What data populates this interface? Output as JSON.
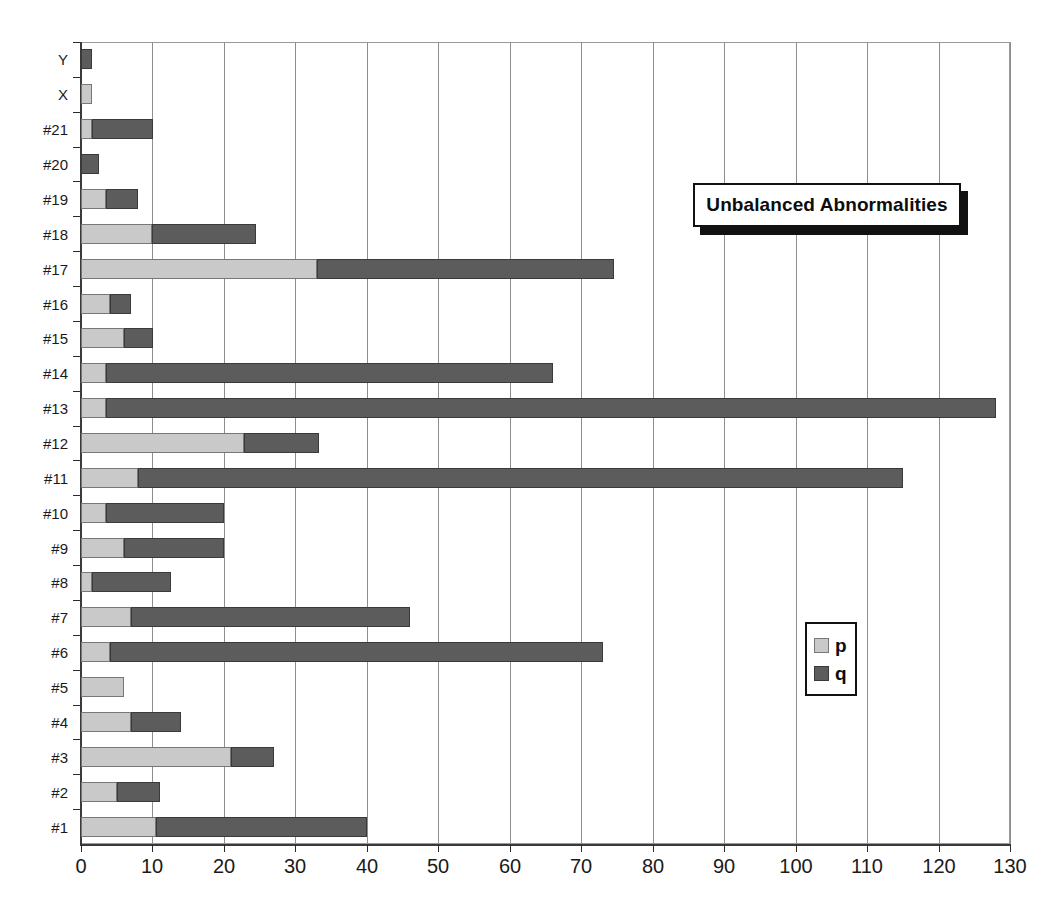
{
  "chart_data": {
    "type": "bar",
    "orientation": "horizontal",
    "stacked": true,
    "title": "Unbalanced Abnormalities",
    "xlabel": "",
    "ylabel": "",
    "xlim": [
      0,
      130
    ],
    "xticks": [
      0,
      10,
      20,
      30,
      40,
      50,
      60,
      70,
      80,
      90,
      100,
      110,
      120,
      130
    ],
    "xticklabels": [
      "0",
      "10",
      "20",
      "30",
      "40",
      "50",
      "60",
      "70",
      "80",
      "90",
      "100",
      "110",
      "120",
      "130"
    ],
    "grid": "vertical",
    "legend_position": "inside-right",
    "categories": [
      "#1",
      "#2",
      "#3",
      "#4",
      "#5",
      "#6",
      "#7",
      "#8",
      "#9",
      "#10",
      "#11",
      "#12",
      "#13",
      "#14",
      "#15",
      "#16",
      "#17",
      "#18",
      "#19",
      "#20",
      "#21",
      "X",
      "Y"
    ],
    "series": [
      {
        "name": "p",
        "color": "#c9c9c9",
        "values": [
          10.5,
          5,
          21,
          7,
          6,
          4,
          7,
          1.5,
          6,
          3.5,
          8,
          22.8,
          3.5,
          3.5,
          6,
          4,
          33,
          10,
          3.5,
          0,
          1.5,
          1.5,
          0
        ]
      },
      {
        "name": "q",
        "color": "#5c5c5c",
        "values": [
          29.5,
          6,
          6,
          7,
          0,
          69,
          39,
          11,
          14,
          16.5,
          107,
          10.5,
          124.5,
          62.5,
          4,
          3,
          41.5,
          14.5,
          4.5,
          2.5,
          8.5,
          0,
          1.5
        ]
      }
    ],
    "totals": [
      40,
      11,
      27,
      14,
      6,
      73,
      46,
      12.5,
      20,
      20,
      115,
      33.3,
      128,
      66,
      10,
      7,
      74.5,
      24.5,
      8,
      2.5,
      10,
      1.5,
      1.5
    ]
  },
  "legend": {
    "items": [
      {
        "label": "p",
        "color": "#c9c9c9"
      },
      {
        "label": "q",
        "color": "#5c5c5c"
      }
    ]
  },
  "colors": {
    "series_p": "#c9c9c9",
    "series_q": "#5c5c5c",
    "axis": "#2b2b2b",
    "grid": "#8e8e8e",
    "text": "#1a1a1a",
    "background": "#ffffff"
  }
}
